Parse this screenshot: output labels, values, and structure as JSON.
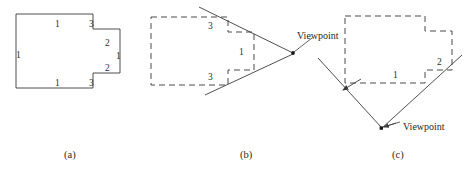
{
  "figure": {
    "panels": [
      {
        "id": "a",
        "caption": "(a)",
        "caption_x": 64,
        "caption_y": 150,
        "description": "solid outline polygon with edge length labels",
        "edge_labels": [
          {
            "text": "1",
            "x": 55,
            "y": 20
          },
          {
            "text": "3",
            "x": 89,
            "y": 20
          },
          {
            "text": "1",
            "x": 16,
            "y": 51
          },
          {
            "text": "2",
            "x": 105,
            "y": 39
          },
          {
            "text": "1",
            "x": 116,
            "y": 52
          },
          {
            "text": "2",
            "x": 105,
            "y": 64
          },
          {
            "text": "1",
            "x": 55,
            "y": 79
          },
          {
            "text": "3",
            "x": 89,
            "y": 79
          }
        ]
      },
      {
        "id": "b",
        "caption": "(b)",
        "caption_x": 240,
        "caption_y": 150,
        "description": "dashed polygon with viewpoint to the right and two rays",
        "viewpoint_label": "Viewpoint",
        "viewpoint_label_x": 297,
        "viewpoint_label_y": 31,
        "edge_labels": [
          {
            "text": "3",
            "x": 208,
            "y": 22
          },
          {
            "text": "1",
            "x": 239,
            "y": 48
          },
          {
            "text": "3",
            "x": 208,
            "y": 73
          }
        ]
      },
      {
        "id": "c",
        "caption": "(c)",
        "caption_x": 392,
        "caption_y": 150,
        "description": "dashed polygon with viewpoint below and two rays",
        "viewpoint_label": "Viewpoint",
        "viewpoint_label_x": 403,
        "viewpoint_label_y": 122,
        "edge_labels": [
          {
            "text": "1",
            "x": 393,
            "y": 71
          },
          {
            "text": "2",
            "x": 437,
            "y": 58
          }
        ]
      }
    ],
    "colors": {
      "stroke": "#3b3b3b",
      "dashed_stroke": "#4a4a4a",
      "text": "#2e2e2e",
      "background": "#ffffff"
    }
  },
  "geometry": {
    "panel_a_outline": "M 16,14 L 93,14 L 93,29 L 120,29 L 120,73 L 93,73 L 93,88 L 16,88 Z",
    "panel_b_outline": "M 151,17 L 228,17 L 228,32 L 254,32 L 254,70 L 228,70 L 228,85 L 151,85 Z",
    "panel_b_ray_upper": "M 199,7 L 293,53",
    "panel_b_ray_lower": "M 205,95 L 293,54",
    "panel_b_vp_x": 293,
    "panel_b_vp_y": 53,
    "panel_b_leader": "M 294,52 L 312,39",
    "panel_c_outline": "M 345,16 L 425,16 L 425,31 L 452,31 L 452,70 L 425,70 L 425,83 L 345,83 Z",
    "panel_c_ray_left": "M 318,58 L 381,127",
    "panel_c_ray_right": "M 462,55 L 382,128",
    "panel_c_vp_x": 381,
    "panel_c_vp_y": 128,
    "panel_c_leader": "M 383,127 L 400,121",
    "panel_c_arrow_mid_x": 347,
    "panel_c_arrow_mid_y": 89
  }
}
